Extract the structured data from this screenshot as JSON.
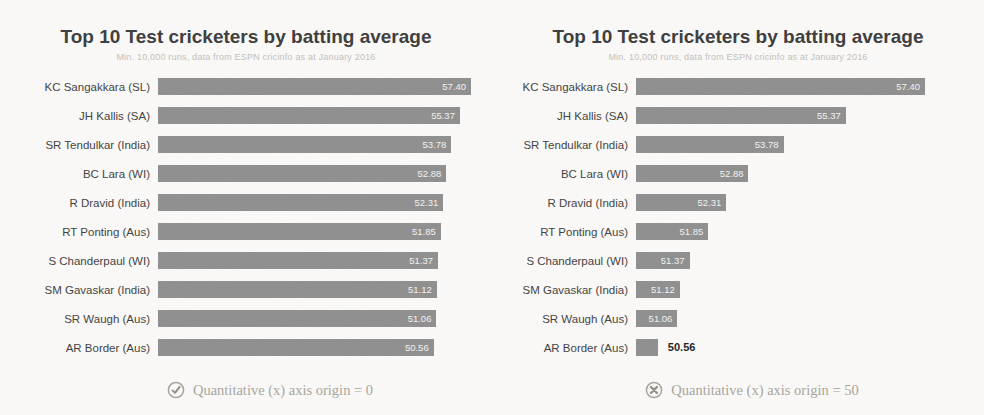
{
  "colors": {
    "bar": "#8f8f8f",
    "value_label_inside": "#f4f3f1",
    "value_label_outside": "#1e1e1e",
    "title": "#3c3c3c",
    "subtitle": "#c3c0ba",
    "caption": "#a8a59b",
    "background": "#fbfaf8"
  },
  "panels": [
    {
      "caption_icon": "check-circle-icon"
    },
    {
      "caption_icon": "cross-circle-icon"
    }
  ],
  "chart_data": [
    {
      "type": "bar",
      "orientation": "horizontal",
      "title": "Top 10 Test cricketers by batting average",
      "subtitle": "Min. 10,000 runs, data from ESPN cricinfo as at January 2016",
      "categories": [
        "KC Sangakkara (SL)",
        "JH Kallis (SA)",
        "SR Tendulkar (India)",
        "BC Lara (WI)",
        "R Dravid (India)",
        "RT Ponting (Aus)",
        "S Chanderpaul (WI)",
        "SM Gavaskar (India)",
        "SR Waugh (Aus)",
        "AR Border (Aus)"
      ],
      "values": [
        57.4,
        55.37,
        53.78,
        52.88,
        52.31,
        51.85,
        51.37,
        51.12,
        51.06,
        50.56
      ],
      "value_labels": [
        "57.40",
        "55.37",
        "53.78",
        "52.88",
        "52.31",
        "51.85",
        "51.37",
        "51.12",
        "51.06",
        "50.56"
      ],
      "xlim": [
        0,
        57.4
      ],
      "grid": false,
      "legend": false,
      "annotation": "Quantitative (x) axis origin = 0"
    },
    {
      "type": "bar",
      "orientation": "horizontal",
      "title": "Top 10 Test cricketers by batting average",
      "subtitle": "Min. 10,000 runs, data from ESPN cricinfo as at January 2016",
      "categories": [
        "KC Sangakkara (SL)",
        "JH Kallis (SA)",
        "SR Tendulkar (India)",
        "BC Lara (WI)",
        "R Dravid (India)",
        "RT Ponting (Aus)",
        "S Chanderpaul (WI)",
        "SM Gavaskar (India)",
        "SR Waugh (Aus)",
        "AR Border (Aus)"
      ],
      "values": [
        57.4,
        55.37,
        53.78,
        52.88,
        52.31,
        51.85,
        51.37,
        51.12,
        51.06,
        50.56
      ],
      "value_labels": [
        "57.40",
        "55.37",
        "53.78",
        "52.88",
        "52.31",
        "51.85",
        "51.37",
        "51.12",
        "51.06",
        "50.56"
      ],
      "xlim": [
        50,
        57.4
      ],
      "grid": false,
      "legend": false,
      "annotation": "Quantitative (x) axis origin = 50"
    }
  ]
}
